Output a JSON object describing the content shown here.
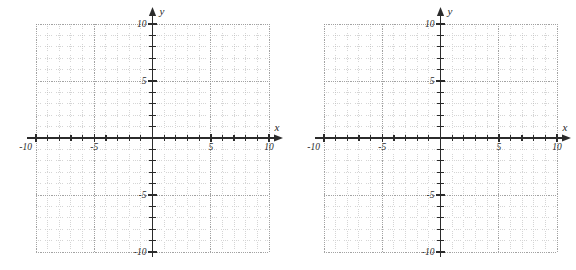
{
  "page": {
    "background_color": "#ffffff",
    "graph_count": 2
  },
  "style": {
    "axis_color": "#2b2b2b",
    "minor_grid_color": "#b9b9b9",
    "major_grid_color": "#8c8c8c",
    "label_color": "#2b2b2b"
  },
  "graphs": [
    {
      "id": "graph-left",
      "name": "left-coordinate-plane",
      "x_axis_label": "x",
      "y_axis_label": "y",
      "x_tick_labels": [
        {
          "value": -10,
          "text": "-10"
        },
        {
          "value": -5,
          "text": "-5"
        },
        {
          "value": 5,
          "text": "5"
        },
        {
          "value": 10,
          "text": "10"
        }
      ],
      "y_tick_labels": [
        {
          "value": 10,
          "text": "10"
        },
        {
          "value": 5,
          "text": "5"
        },
        {
          "value": -5,
          "text": "-5"
        },
        {
          "value": -10,
          "text": "-10"
        }
      ]
    },
    {
      "id": "graph-right",
      "name": "right-coordinate-plane",
      "x_axis_label": "x",
      "y_axis_label": "y",
      "x_tick_labels": [
        {
          "value": -10,
          "text": "-10"
        },
        {
          "value": -5,
          "text": "-5"
        },
        {
          "value": 5,
          "text": "5"
        },
        {
          "value": 10,
          "text": "10"
        }
      ],
      "y_tick_labels": [
        {
          "value": 10,
          "text": "10"
        },
        {
          "value": 5,
          "text": "5"
        },
        {
          "value": -5,
          "text": "-5"
        },
        {
          "value": -10,
          "text": "-10"
        }
      ]
    }
  ],
  "chart_data": [
    {
      "type": "scatter",
      "title": "",
      "subtitle": "",
      "xlabel": "x",
      "ylabel": "y",
      "xlim": [
        -10,
        10
      ],
      "ylim": [
        -10,
        10
      ],
      "xticks": [
        -10,
        -9,
        -8,
        -7,
        -6,
        -5,
        -4,
        -3,
        -2,
        -1,
        0,
        1,
        2,
        3,
        4,
        5,
        6,
        7,
        8,
        9,
        10
      ],
      "yticks": [
        -10,
        -9,
        -8,
        -7,
        -6,
        -5,
        -4,
        -3,
        -2,
        -1,
        0,
        1,
        2,
        3,
        4,
        5,
        6,
        7,
        8,
        9,
        10
      ],
      "xtick_labels": [
        "-10",
        "-5",
        "5",
        "10"
      ],
      "ytick_labels": [
        "10",
        "5",
        "-5",
        "-10"
      ],
      "labeled_xticks": [
        -10,
        -5,
        5,
        10
      ],
      "labeled_yticks": [
        10,
        5,
        -5,
        -10
      ],
      "grid": true,
      "grid_minor_step": 1,
      "grid_major_step": 2.5,
      "legend": null,
      "series": [],
      "annotations": [],
      "notes": "Blank coordinate plane, no plotted data"
    },
    {
      "type": "scatter",
      "title": "",
      "subtitle": "",
      "xlabel": "x",
      "ylabel": "y",
      "xlim": [
        -10,
        10
      ],
      "ylim": [
        -10,
        10
      ],
      "xticks": [
        -10,
        -9,
        -8,
        -7,
        -6,
        -5,
        -4,
        -3,
        -2,
        -1,
        0,
        1,
        2,
        3,
        4,
        5,
        6,
        7,
        8,
        9,
        10
      ],
      "yticks": [
        -10,
        -9,
        -8,
        -7,
        -6,
        -5,
        -4,
        -3,
        -2,
        -1,
        0,
        1,
        2,
        3,
        4,
        5,
        6,
        7,
        8,
        9,
        10
      ],
      "xtick_labels": [
        "-10",
        "-5",
        "5",
        "10"
      ],
      "ytick_labels": [
        "10",
        "5",
        "-5",
        "-10"
      ],
      "labeled_xticks": [
        -10,
        -5,
        5,
        10
      ],
      "labeled_yticks": [
        10,
        5,
        -5,
        -10
      ],
      "grid": true,
      "grid_minor_step": 1,
      "grid_major_step": 2.5,
      "legend": null,
      "series": [],
      "annotations": [],
      "notes": "Blank coordinate plane, no plotted data"
    }
  ]
}
